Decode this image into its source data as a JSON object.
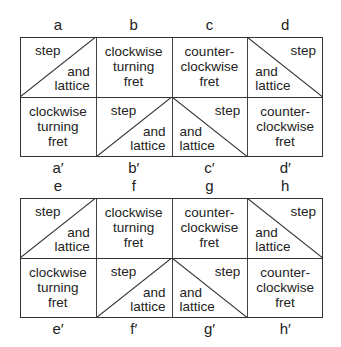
{
  "blocks": [
    {
      "top_labels": [
        "a",
        "b",
        "c",
        "d"
      ],
      "bottom_labels": [
        "a′",
        "b′",
        "c′",
        "d′"
      ],
      "top_row": [
        {
          "type": "diag-up",
          "upper": "step",
          "lower_1": "and",
          "lower_2": "lattice"
        },
        {
          "type": "text",
          "lines": [
            "clockwise",
            "turning",
            "fret"
          ]
        },
        {
          "type": "text",
          "lines": [
            "counter-",
            "clockwise",
            "fret"
          ]
        },
        {
          "type": "diag-down",
          "upper": "step",
          "lower_1": "and",
          "lower_2": "lattice"
        }
      ],
      "bottom_row": [
        {
          "type": "text",
          "lines": [
            "clockwise",
            "turning",
            "fret"
          ]
        },
        {
          "type": "diag-up",
          "upper": "step",
          "lower_1": "and",
          "lower_2": "lattice"
        },
        {
          "type": "diag-down",
          "upper": "step",
          "lower_1": "and",
          "lower_2": "lattice"
        },
        {
          "type": "text",
          "lines": [
            "counter-",
            "clockwise",
            "fret"
          ]
        }
      ]
    },
    {
      "top_labels": [
        "e",
        "f",
        "g",
        "h"
      ],
      "bottom_labels": [
        "e′",
        "f′",
        "g′",
        "h′"
      ],
      "top_row": [
        {
          "type": "diag-up",
          "upper": "step",
          "lower_1": "and",
          "lower_2": "lattice"
        },
        {
          "type": "text",
          "lines": [
            "clockwise",
            "turning",
            "fret"
          ]
        },
        {
          "type": "text",
          "lines": [
            "counter-",
            "clockwise",
            "fret"
          ]
        },
        {
          "type": "diag-down",
          "upper": "step",
          "lower_1": "and",
          "lower_2": "lattice"
        }
      ],
      "bottom_row": [
        {
          "type": "text",
          "lines": [
            "clockwise",
            "turning",
            "fret"
          ]
        },
        {
          "type": "diag-up",
          "upper": "step",
          "lower_1": "and",
          "lower_2": "lattice"
        },
        {
          "type": "diag-down",
          "upper": "step",
          "lower_1": "and",
          "lower_2": "lattice"
        },
        {
          "type": "text",
          "lines": [
            "counter-",
            "clockwise",
            "fret"
          ]
        }
      ]
    }
  ]
}
